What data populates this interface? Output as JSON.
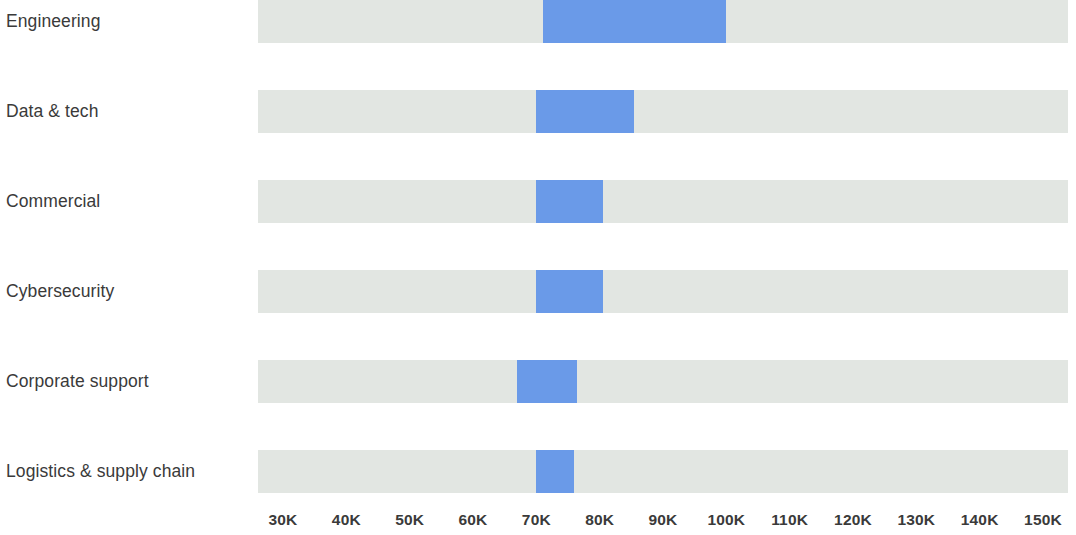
{
  "chart_data": {
    "type": "bar",
    "subtype": "horizontal-range-bar",
    "title": "",
    "subtitle": "",
    "xlabel": "",
    "ylabel": "",
    "xlim": [
      25000,
      155000
    ],
    "grid": false,
    "legend": null,
    "axis": {
      "tick_values": [
        30000,
        40000,
        50000,
        60000,
        70000,
        80000,
        90000,
        100000,
        110000,
        120000,
        130000,
        140000,
        150000
      ],
      "tick_labels": [
        "30K",
        "40K",
        "50K",
        "60K",
        "70K",
        "80K",
        "90K",
        "100K",
        "110K",
        "120K",
        "130K",
        "140K",
        "150K"
      ]
    },
    "colors": {
      "range": "#6a9ae8",
      "track": "#e2e6e2",
      "text": "#3a3a3a",
      "background": "#ffffff"
    },
    "categories": [
      "Engineering",
      "Data & tech",
      "Commercial",
      "Cybersecurity",
      "Corporate support",
      "Logistics & supply chain"
    ],
    "series": [
      {
        "name": "range_low",
        "values": [
          71000,
          70000,
          70000,
          70000,
          67000,
          70000
        ]
      },
      {
        "name": "range_high",
        "values": [
          100000,
          85500,
          80500,
          80500,
          76500,
          76000
        ]
      },
      {
        "name": "track_low",
        "values": [
          26000,
          26000,
          26000,
          26000,
          26000,
          26000
        ]
      },
      {
        "name": "track_high",
        "values": [
          154000,
          154000,
          154000,
          154000,
          154000,
          154000
        ]
      }
    ],
    "rows": [
      {
        "label": "Engineering",
        "low": 71000,
        "high": 100000
      },
      {
        "label": "Data & tech",
        "low": 70000,
        "high": 85500
      },
      {
        "label": "Commercial",
        "low": 70000,
        "high": 80500
      },
      {
        "label": "Cybersecurity",
        "low": 70000,
        "high": 80500
      },
      {
        "label": "Corporate support",
        "low": 67000,
        "high": 76500
      },
      {
        "label": "Logistics & supply chain",
        "low": 70000,
        "high": 76000
      }
    ]
  }
}
